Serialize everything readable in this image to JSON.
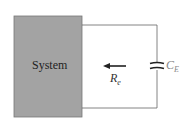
{
  "diagram": {
    "system_label": "System",
    "resistance_label": {
      "main": "R",
      "sub": "e"
    },
    "capacitor_label": {
      "main": "C",
      "sub": "E"
    },
    "colors": {
      "system_fill": "#a0a0a0",
      "wire": "#555555",
      "text": "#333333",
      "capacitor_label": "#888888"
    }
  }
}
